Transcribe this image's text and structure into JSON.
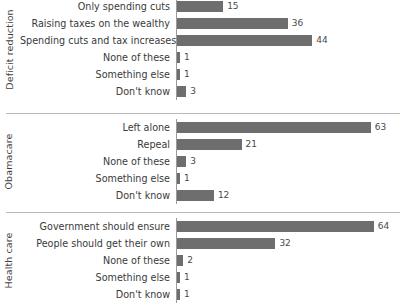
{
  "chart_data": {
    "type": "bar",
    "title": "",
    "subtitle": "",
    "xlabel": "",
    "ylabel": "",
    "orientation": "horizontal",
    "grid": false,
    "legend": "none",
    "xlim": [
      0,
      70
    ],
    "bar_color": "#6e6e6e",
    "axis_color": "#9a9a9a",
    "separator_color": "#b9b9b9",
    "panels": [
      {
        "group_label": "Deficit reduction",
        "categories": [
          "Only spending cuts",
          "Raising taxes on the wealthy",
          "Spending cuts and tax increases",
          "None of these",
          "Something else",
          "Don't know"
        ],
        "values": [
          15,
          36,
          44,
          1,
          1,
          3
        ]
      },
      {
        "group_label": "Obamacare",
        "categories": [
          "Left alone",
          "Repeal",
          "None of these",
          "Something else",
          "Don't know"
        ],
        "values": [
          63,
          21,
          3,
          1,
          12
        ]
      },
      {
        "group_label": "Health care",
        "categories": [
          "Government should ensure",
          "People should get their own",
          "None of these",
          "Something else",
          "Don't know"
        ],
        "values": [
          64,
          32,
          2,
          1,
          1
        ]
      }
    ]
  }
}
